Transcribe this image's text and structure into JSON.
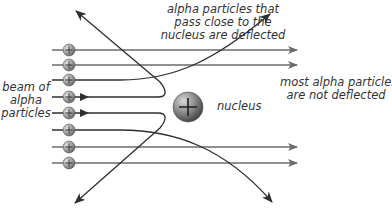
{
  "diagram": {
    "labels": {
      "top": "alpha particles that\npass close to the\nnucleus are deflected",
      "top_lines": [
        "alpha particles that",
        "pass close to the",
        "nucleus are deflected"
      ],
      "right_lines": [
        "most alpha particles",
        "are not deflected"
      ],
      "left_lines": [
        "beam of",
        "alpha",
        "particles"
      ],
      "nucleus": "nucleus"
    },
    "particle_symbol": "+",
    "nucleus_symbol": "+",
    "beam_rows_y": [
      50,
      65,
      80,
      97,
      113,
      130,
      147,
      163
    ],
    "colors": {
      "straight_line": "#6b6b6b",
      "deflected_line": "#2f2f2f",
      "particle_fill": "#9a9a9a",
      "nucleus_fill": "#7a7a7a",
      "text": "#333333"
    }
  }
}
